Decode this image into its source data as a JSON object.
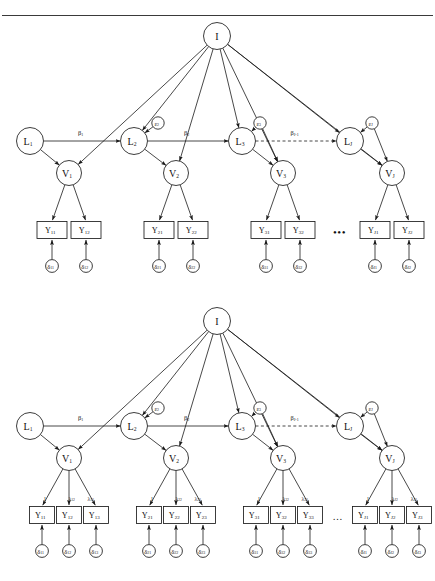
{
  "figure": {
    "type": "path-diagram",
    "top_rule": true
  },
  "panels": [
    {
      "id": "panel-top",
      "indicators_per_factor": 2,
      "intercept": {
        "label": "I"
      },
      "latent_L": [
        {
          "label": "L",
          "sub": "1"
        },
        {
          "label": "L",
          "sub": "2"
        },
        {
          "label": "L",
          "sub": "3"
        },
        {
          "label": "L",
          "sub": "J"
        }
      ],
      "latent_V": [
        {
          "label": "V",
          "sub": "1"
        },
        {
          "label": "V",
          "sub": "2"
        },
        {
          "label": "V",
          "sub": "3"
        },
        {
          "label": "V",
          "sub": "J"
        }
      ],
      "disturbances": [
        {
          "label": "ε",
          "sub": "2"
        },
        {
          "label": "ε",
          "sub": "3"
        },
        {
          "label": "ε",
          "sub": "J"
        }
      ],
      "betas": [
        {
          "label": "β",
          "sub": "1"
        },
        {
          "label": "β",
          "sub": "2"
        },
        {
          "label": "β",
          "sub": "J-1"
        }
      ],
      "indicators": [
        [
          {
            "label": "Y",
            "sub": "11"
          },
          {
            "label": "Y",
            "sub": "12"
          }
        ],
        [
          {
            "label": "Y",
            "sub": "21"
          },
          {
            "label": "Y",
            "sub": "22"
          }
        ],
        [
          {
            "label": "Y",
            "sub": "31"
          },
          {
            "label": "Y",
            "sub": "32"
          }
        ],
        [
          {
            "label": "Y",
            "sub": "J1"
          },
          {
            "label": "Y",
            "sub": "J2"
          }
        ]
      ],
      "errors": [
        [
          {
            "label": "δ",
            "sub": "11"
          },
          {
            "label": "δ",
            "sub": "12"
          }
        ],
        [
          {
            "label": "δ",
            "sub": "21"
          },
          {
            "label": "δ",
            "sub": "22"
          }
        ],
        [
          {
            "label": "δ",
            "sub": "31"
          },
          {
            "label": "δ",
            "sub": "32"
          }
        ],
        [
          {
            "label": "δ",
            "sub": "J1"
          },
          {
            "label": "δ",
            "sub": "J2"
          }
        ]
      ],
      "ellipsis": "•••"
    },
    {
      "id": "panel-bottom",
      "indicators_per_factor": 3,
      "intercept": {
        "label": "I"
      },
      "latent_L": [
        {
          "label": "L",
          "sub": "1"
        },
        {
          "label": "L",
          "sub": "2"
        },
        {
          "label": "L",
          "sub": "3"
        },
        {
          "label": "L",
          "sub": "J"
        }
      ],
      "latent_V": [
        {
          "label": "V",
          "sub": "1"
        },
        {
          "label": "V",
          "sub": "2"
        },
        {
          "label": "V",
          "sub": "3"
        },
        {
          "label": "V",
          "sub": "J"
        }
      ],
      "disturbances": [
        {
          "label": "ε",
          "sub": "2"
        },
        {
          "label": "ε",
          "sub": "3"
        },
        {
          "label": "ε",
          "sub": "J"
        }
      ],
      "betas": [
        {
          "label": "β",
          "sub": "1"
        },
        {
          "label": "β",
          "sub": "2"
        },
        {
          "label": "β",
          "sub": "J-1"
        }
      ],
      "loadings": [
        [
          {
            "label": "1",
            "sub": ""
          },
          {
            "label": "λ",
            "sub": "12"
          },
          {
            "label": "λ",
            "sub": "13"
          }
        ],
        [
          {
            "label": "1",
            "sub": ""
          },
          {
            "label": "λ",
            "sub": "22"
          },
          {
            "label": "λ",
            "sub": "23"
          }
        ],
        [
          {
            "label": "1",
            "sub": ""
          },
          {
            "label": "λ",
            "sub": "32"
          },
          {
            "label": "λ",
            "sub": "33"
          }
        ],
        [
          {
            "label": "1",
            "sub": ""
          },
          {
            "label": "λ",
            "sub": "J2"
          },
          {
            "label": "λ",
            "sub": "J3"
          }
        ]
      ],
      "indicators": [
        [
          {
            "label": "Y",
            "sub": "11"
          },
          {
            "label": "Y",
            "sub": "12"
          },
          {
            "label": "Y",
            "sub": "13"
          }
        ],
        [
          {
            "label": "Y",
            "sub": "21"
          },
          {
            "label": "Y",
            "sub": "22"
          },
          {
            "label": "Y",
            "sub": "23"
          }
        ],
        [
          {
            "label": "Y",
            "sub": "31"
          },
          {
            "label": "Y",
            "sub": "32"
          },
          {
            "label": "Y",
            "sub": "33"
          }
        ],
        [
          {
            "label": "Y",
            "sub": "J1"
          },
          {
            "label": "Y",
            "sub": "J2"
          },
          {
            "label": "Y",
            "sub": "J3"
          }
        ]
      ],
      "errors": [
        [
          {
            "label": "δ",
            "sub": "11"
          },
          {
            "label": "δ",
            "sub": "12"
          },
          {
            "label": "δ",
            "sub": "13"
          }
        ],
        [
          {
            "label": "δ",
            "sub": "21"
          },
          {
            "label": "δ",
            "sub": "22"
          },
          {
            "label": "δ",
            "sub": "23"
          }
        ],
        [
          {
            "label": "δ",
            "sub": "31"
          },
          {
            "label": "δ",
            "sub": "32"
          },
          {
            "label": "δ",
            "sub": "33"
          }
        ],
        [
          {
            "label": "δ",
            "sub": "J1"
          },
          {
            "label": "δ",
            "sub": "J2"
          },
          {
            "label": "δ",
            "sub": "J3"
          }
        ]
      ],
      "ellipsis": "…"
    }
  ],
  "style": {
    "stroke": "#1a1a1a",
    "text": "#111111",
    "background": "#ffffff"
  }
}
